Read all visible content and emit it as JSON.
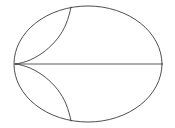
{
  "figure": {
    "type": "line-diagram",
    "background_color": "#ffffff",
    "stroke_color": "#3a3a3a",
    "stroke_color_axis": "#4a4a4a",
    "stroke_width": 0.9,
    "canvas": {
      "width": 175,
      "height": 128
    },
    "elements": [
      {
        "name": "outer-ellipse",
        "kind": "ellipse",
        "center": [
          88,
          64
        ],
        "rx": 74,
        "ry": 58,
        "stroke": "#3a3a3a",
        "stroke_width": 0.9,
        "fill": "none"
      },
      {
        "name": "major-axis-chord",
        "kind": "line",
        "from": [
          15,
          64
        ],
        "to": [
          162,
          64
        ],
        "stroke": "#4a4a4a",
        "stroke_width": 0.9
      },
      {
        "name": "upper-cusp-arc",
        "kind": "path",
        "path": "M 15 64 C 36 62 58 44 66 24 C 68.5 18 70 12 71 7",
        "cusp_point": [
          15,
          64
        ],
        "endpoint_on_ellipse": [
          71,
          7
        ],
        "stroke": "#3a3a3a",
        "stroke_width": 0.9,
        "fill": "none"
      },
      {
        "name": "lower-cusp-arc",
        "kind": "path",
        "path": "M 15 64 C 36 66 58 84 66 104 C 68.5 110 70 116 71 121",
        "cusp_point": [
          15,
          64
        ],
        "endpoint_on_ellipse": [
          71,
          121
        ],
        "stroke": "#3a3a3a",
        "stroke_width": 0.9,
        "fill": "none"
      }
    ],
    "annotations": {
      "labels": [],
      "has_text": false,
      "has_axes_ticks": false,
      "has_legend": false
    }
  }
}
